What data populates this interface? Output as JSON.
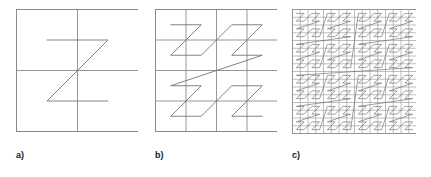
{
  "figure": {
    "background_color": "#ffffff",
    "stroke_color": "#6e6e6e",
    "grid_color": "#8a8a8a",
    "border_color": "#8a8a8a",
    "label_color": "#1a1a1a"
  },
  "panels": [
    {
      "id": "a",
      "label": "a)",
      "order": 1,
      "grid_divisions": 2,
      "curve_segments": 3,
      "size_px": 122,
      "description": "Single Z-shape inside a square divided into a 2 by 2 grid"
    },
    {
      "id": "b",
      "label": "b)",
      "order": 2,
      "grid_divisions": 4,
      "curve_segments": 15,
      "size_px": 122,
      "description": "Four Z-shapes joined by a large Z inside a square divided into a 4 by 4 grid"
    },
    {
      "id": "c",
      "label": "c)",
      "order": 4,
      "grid_divisions": 16,
      "curve_segments": 255,
      "size_px": 124,
      "description": "Dense Z-order curve inside a square divided into a 16 by 16 grid"
    }
  ],
  "chart_data": {
    "type": "line",
    "xlabel": "",
    "ylabel": "",
    "grid": true,
    "legend": null,
    "series": [
      {
        "name": "a) order 1",
        "grid": 2,
        "points_per_side": 2,
        "vertices": 4
      },
      {
        "name": "b) order 2",
        "grid": 4,
        "points_per_side": 4,
        "vertices": 16
      },
      {
        "name": "c) order 4",
        "grid": 16,
        "points_per_side": 16,
        "vertices": 256
      }
    ],
    "xlim": [
      0,
      1
    ],
    "ylim": [
      0,
      1
    ]
  }
}
